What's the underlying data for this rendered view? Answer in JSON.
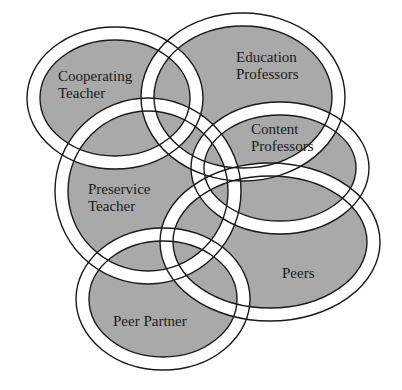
{
  "diagram": {
    "type": "overlapping-ring-venn",
    "colors": {
      "background": "#ffffff",
      "fill": "#a9a9a9",
      "ring": "#ffffff",
      "stroke": "#1a1a1a",
      "text": "#1a1a1a"
    },
    "ring_width": 13,
    "sets": [
      {
        "id": "cooperating-teacher",
        "label_lines": [
          "Cooperating",
          "Teacher"
        ],
        "cx": 115,
        "cy": 98,
        "rx": 88,
        "ry": 71,
        "label_x": 58,
        "label_y": 68
      },
      {
        "id": "education-professors",
        "label_lines": [
          "Education",
          "Professors"
        ],
        "cx": 243,
        "cy": 97,
        "rx": 102,
        "ry": 84,
        "label_x": 236,
        "label_y": 49
      },
      {
        "id": "content-professors",
        "label_lines": [
          "Content",
          "Professors"
        ],
        "cx": 280,
        "cy": 168,
        "rx": 89,
        "ry": 66,
        "label_x": 251,
        "label_y": 121
      },
      {
        "id": "preservice-teacher",
        "label_lines": [
          "Preservice",
          "Teacher"
        ],
        "cx": 148,
        "cy": 191,
        "rx": 93,
        "ry": 93,
        "label_x": 88,
        "label_y": 181
      },
      {
        "id": "peers",
        "label_lines": [
          "Peers"
        ],
        "cx": 270,
        "cy": 242,
        "rx": 110,
        "ry": 79,
        "label_x": 282,
        "label_y": 265
      },
      {
        "id": "peer-partner",
        "label_lines": [
          "Peer Partner"
        ],
        "cx": 163,
        "cy": 299,
        "rx": 87,
        "ry": 71,
        "label_x": 113,
        "label_y": 313
      }
    ]
  }
}
